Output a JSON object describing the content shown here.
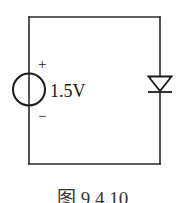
{
  "figure": {
    "caption": "图 9.4.10",
    "colors": {
      "line": "#2a2a2a",
      "background": "#ffffff"
    }
  },
  "circuit": {
    "source": {
      "type": "dc-voltage-source",
      "value_label": "1.5V",
      "plus_label": "+",
      "minus_label": "−"
    },
    "diode": {
      "type": "diode",
      "orientation": "anode-top, cathode-bottom"
    }
  }
}
